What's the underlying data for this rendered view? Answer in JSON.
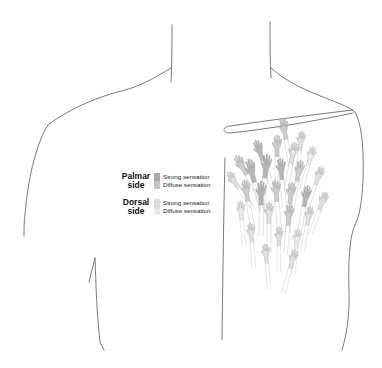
{
  "figure": {
    "outline_color": "#6a6a6a"
  },
  "legend": {
    "groups": [
      {
        "side": "Palmar side",
        "side_line1": "Palmar",
        "side_line2": "side",
        "entries": [
          {
            "label": "Strong sensation",
            "color": "#a9a9a9"
          },
          {
            "label": "Diffuse sensation",
            "color": "#c4c4c4"
          }
        ]
      },
      {
        "side": "Dorsal side",
        "side_line1": "Dorsal",
        "side_line2": "side",
        "entries": [
          {
            "label": "Strong sensation",
            "color": "#dcdcdc"
          },
          {
            "label": "Diffuse sensation",
            "color": "#e8e8e8"
          }
        ]
      }
    ]
  },
  "hands": [
    {
      "x": 283,
      "y": 128,
      "s": 1.0,
      "r": -10,
      "c": "#c4c4c4"
    },
    {
      "x": 300,
      "y": 140,
      "s": 0.9,
      "r": 5,
      "c": "#dcdcdc"
    },
    {
      "x": 258,
      "y": 150,
      "s": 1.0,
      "r": -20,
      "c": "#a9a9a9"
    },
    {
      "x": 276,
      "y": 145,
      "s": 1.0,
      "r": 0,
      "c": "#c4c4c4"
    },
    {
      "x": 292,
      "y": 152,
      "s": 1.0,
      "r": 10,
      "c": "#dcdcdc"
    },
    {
      "x": 310,
      "y": 155,
      "s": 0.9,
      "r": 15,
      "c": "#e8e8e8"
    },
    {
      "x": 240,
      "y": 165,
      "s": 1.0,
      "r": -30,
      "c": "#c4c4c4"
    },
    {
      "x": 250,
      "y": 170,
      "s": 1.1,
      "r": -15,
      "c": "#a9a9a9"
    },
    {
      "x": 265,
      "y": 165,
      "s": 1.1,
      "r": 5,
      "c": "#a9a9a9"
    },
    {
      "x": 280,
      "y": 168,
      "s": 1.0,
      "r": -5,
      "c": "#a9a9a9"
    },
    {
      "x": 298,
      "y": 170,
      "s": 1.0,
      "r": 10,
      "c": "#c4c4c4"
    },
    {
      "x": 318,
      "y": 175,
      "s": 0.9,
      "r": 20,
      "c": "#dcdcdc"
    },
    {
      "x": 232,
      "y": 180,
      "s": 0.9,
      "r": -35,
      "c": "#dcdcdc"
    },
    {
      "x": 245,
      "y": 190,
      "s": 1.0,
      "r": -10,
      "c": "#c4c4c4"
    },
    {
      "x": 260,
      "y": 192,
      "s": 1.1,
      "r": 0,
      "c": "#a9a9a9"
    },
    {
      "x": 275,
      "y": 190,
      "s": 1.0,
      "r": -5,
      "c": "#c4c4c4"
    },
    {
      "x": 290,
      "y": 192,
      "s": 1.0,
      "r": 5,
      "c": "#c4c4c4"
    },
    {
      "x": 305,
      "y": 195,
      "s": 1.0,
      "r": 10,
      "c": "#a9a9a9"
    },
    {
      "x": 322,
      "y": 200,
      "s": 0.9,
      "r": 20,
      "c": "#dcdcdc"
    },
    {
      "x": 240,
      "y": 210,
      "s": 0.9,
      "r": -5,
      "c": "#e8e8e8"
    },
    {
      "x": 268,
      "y": 212,
      "s": 1.0,
      "r": 0,
      "c": "#dcdcdc"
    },
    {
      "x": 288,
      "y": 214,
      "s": 1.0,
      "r": 5,
      "c": "#c4c4c4"
    },
    {
      "x": 308,
      "y": 215,
      "s": 0.9,
      "r": 10,
      "c": "#dcdcdc"
    },
    {
      "x": 250,
      "y": 232,
      "s": 0.9,
      "r": -5,
      "c": "#dcdcdc"
    },
    {
      "x": 278,
      "y": 236,
      "s": 0.9,
      "r": 0,
      "c": "#dcdcdc"
    },
    {
      "x": 296,
      "y": 238,
      "s": 0.9,
      "r": 5,
      "c": "#e8e8e8"
    },
    {
      "x": 265,
      "y": 253,
      "s": 0.9,
      "r": -5,
      "c": "#dcdcdc"
    },
    {
      "x": 292,
      "y": 258,
      "s": 0.9,
      "r": 15,
      "c": "#dcdcdc"
    }
  ]
}
